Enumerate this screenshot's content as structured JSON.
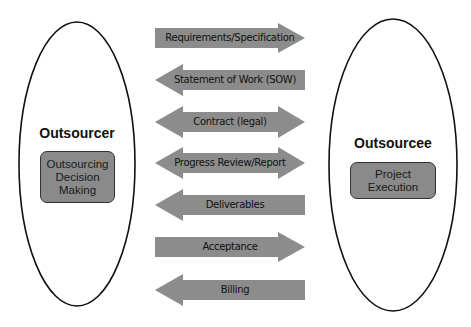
{
  "outsourcer": {
    "title": "Outsourcer",
    "box_label": "Outsourcing Decision Making"
  },
  "outsourcee": {
    "title": "Outsourcee",
    "box_label": "Project Execution"
  },
  "arrows": [
    {
      "label": "Requirements/Specification",
      "direction": "right"
    },
    {
      "label": "Statement of Work (SOW)",
      "direction": "left"
    },
    {
      "label": "Contract (legal)",
      "direction": "both"
    },
    {
      "label": "Progress Review/Report",
      "direction": "both"
    },
    {
      "label": "Deliverables",
      "direction": "left"
    },
    {
      "label": "Acceptance",
      "direction": "right"
    },
    {
      "label": "Billing",
      "direction": "left"
    }
  ],
  "colors": {
    "arrow_fill": "#8c8c8c",
    "box_fill": "#8a8a8a",
    "outline": "#111111"
  }
}
